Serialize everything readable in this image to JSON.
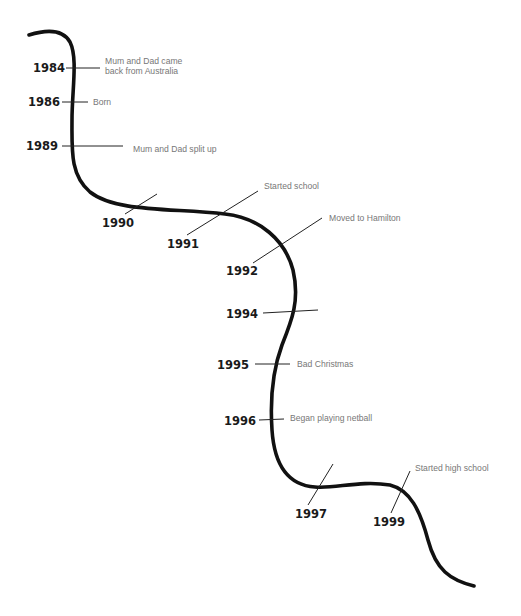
{
  "diagram": {
    "type": "life-timeline",
    "line_color": "#111111",
    "year_color": "#1a1a1a",
    "event_color": "#777777",
    "milestones": [
      {
        "year": "1984",
        "event_line1": "Mum and Dad came",
        "event_line2": "back from Australia"
      },
      {
        "year": "1986",
        "event_line1": "Born",
        "event_line2": ""
      },
      {
        "year": "1989",
        "event_line1": "Mum and Dad split up",
        "event_line2": ""
      },
      {
        "year": "1990",
        "event_line1": "",
        "event_line2": ""
      },
      {
        "year": "1991",
        "event_line1": "Started school",
        "event_line2": ""
      },
      {
        "year": "1992",
        "event_line1": "Moved to Hamilton",
        "event_line2": ""
      },
      {
        "year": "1994",
        "event_line1": "",
        "event_line2": ""
      },
      {
        "year": "1995",
        "event_line1": "Bad Christmas",
        "event_line2": ""
      },
      {
        "year": "1996",
        "event_line1": "Began playing netball",
        "event_line2": ""
      },
      {
        "year": "1997",
        "event_line1": "",
        "event_line2": ""
      },
      {
        "year": "1999",
        "event_line1": "Started high school",
        "event_line2": ""
      }
    ]
  }
}
